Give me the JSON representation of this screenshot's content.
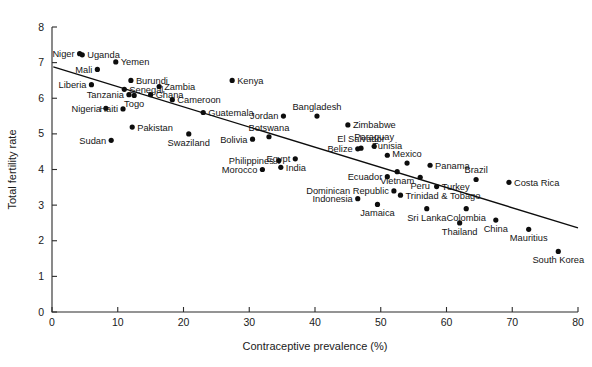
{
  "chart_data": {
    "type": "scatter",
    "title": "",
    "xlabel": "Contraceptive prevalence (%)",
    "ylabel": "Total fertility rate",
    "xlim": [
      0,
      80
    ],
    "ylim": [
      0,
      8
    ],
    "xticks": [
      0,
      10,
      20,
      30,
      40,
      50,
      60,
      70,
      80
    ],
    "yticks": [
      0,
      1,
      2,
      3,
      4,
      5,
      6,
      7,
      8
    ],
    "grid": false,
    "legend": "none",
    "point_color": "#0d0d0d",
    "line_color": "#0d0d0d",
    "trendline": {
      "label": "linear fit",
      "x_start": 0.2,
      "y_start": 6.88,
      "x_end": 80.0,
      "y_end": 2.36
    },
    "points": [
      {
        "label": "Niger",
        "x": 4.2,
        "y": 7.25,
        "lx": "right",
        "ly": "mid"
      },
      {
        "label": "Uganda",
        "x": 4.6,
        "y": 7.22,
        "lx": "left",
        "ly": "mid"
      },
      {
        "label": "Mali",
        "x": 6.9,
        "y": 6.81,
        "lx": "right",
        "ly": "mid"
      },
      {
        "label": "Yemen",
        "x": 9.7,
        "y": 7.02,
        "lx": "left",
        "ly": "mid"
      },
      {
        "label": "Burundi",
        "x": 12.0,
        "y": 6.5,
        "lx": "left",
        "ly": "above"
      },
      {
        "label": "Liberia",
        "x": 6.0,
        "y": 6.38,
        "lx": "right",
        "ly": "mid"
      },
      {
        "label": "Senegal",
        "x": 11.0,
        "y": 6.25,
        "lx": "left",
        "ly": "mid"
      },
      {
        "label": "Zambia",
        "x": 16.3,
        "y": 6.33,
        "lx": "left",
        "ly": "above"
      },
      {
        "label": "Tanzania",
        "x": 11.7,
        "y": 6.1,
        "lx": "right",
        "ly": "mid"
      },
      {
        "label": "Togo",
        "x": 12.5,
        "y": 6.08,
        "lx": "below",
        "ly": "below"
      },
      {
        "label": "Ghana",
        "x": 15.0,
        "y": 6.1,
        "lx": "left",
        "ly": "mid"
      },
      {
        "label": "Nigeria",
        "x": 8.2,
        "y": 5.72,
        "lx": "right",
        "ly": "mid"
      },
      {
        "label": "Haiti",
        "x": 10.8,
        "y": 5.7,
        "lx": "right",
        "ly": "mid"
      },
      {
        "label": "Cameroon",
        "x": 18.3,
        "y": 5.96,
        "lx": "left",
        "ly": "mid"
      },
      {
        "label": "Guatemala",
        "x": 23.0,
        "y": 5.6,
        "lx": "left",
        "ly": "mid"
      },
      {
        "label": "Pakistan",
        "x": 12.2,
        "y": 5.19,
        "lx": "left",
        "ly": "mid"
      },
      {
        "label": "Sudan",
        "x": 9.0,
        "y": 4.82,
        "lx": "right",
        "ly": "mid"
      },
      {
        "label": "Swaziland",
        "x": 20.8,
        "y": 5.0,
        "lx": "below",
        "ly": "below"
      },
      {
        "label": "Kenya",
        "x": 27.4,
        "y": 6.5,
        "lx": "left",
        "ly": "mid"
      },
      {
        "label": "Bangladesh",
        "x": 40.3,
        "y": 5.5,
        "lx": "above",
        "ly": "above"
      },
      {
        "label": "Jordan",
        "x": 35.2,
        "y": 5.5,
        "lx": "right",
        "ly": "mid"
      },
      {
        "label": "Zimbabwe",
        "x": 45.0,
        "y": 5.25,
        "lx": "left",
        "ly": "mid"
      },
      {
        "label": "Botswana",
        "x": 33.0,
        "y": 4.92,
        "lx": "above",
        "ly": "above"
      },
      {
        "label": "Bolivia",
        "x": 30.5,
        "y": 4.85,
        "lx": "right",
        "ly": "mid"
      },
      {
        "label": "El Salvador",
        "x": 47.0,
        "y": 4.6,
        "lx": "above",
        "ly": "above"
      },
      {
        "label": "Paraguay",
        "x": 49.0,
        "y": 4.65,
        "lx": "above",
        "ly": "above"
      },
      {
        "label": "Belize",
        "x": 46.5,
        "y": 4.58,
        "lx": "right",
        "ly": "mid"
      },
      {
        "label": "Tunisia",
        "x": 51.0,
        "y": 4.4,
        "lx": "above",
        "ly": "above"
      },
      {
        "label": "Egypt",
        "x": 37.0,
        "y": 4.3,
        "lx": "right",
        "ly": "mid"
      },
      {
        "label": "Philippines",
        "x": 34.5,
        "y": 4.25,
        "lx": "right",
        "ly": "mid"
      },
      {
        "label": "India",
        "x": 34.8,
        "y": 4.06,
        "lx": "left",
        "ly": "mid"
      },
      {
        "label": "Morocco",
        "x": 32.0,
        "y": 4.0,
        "lx": "right",
        "ly": "mid"
      },
      {
        "label": "Mexico",
        "x": 54.0,
        "y": 4.18,
        "lx": "above",
        "ly": "above"
      },
      {
        "label": "Panama",
        "x": 57.5,
        "y": 4.12,
        "lx": "left",
        "ly": "mid"
      },
      {
        "label": "Vietnam",
        "x": 52.5,
        "y": 3.94,
        "lx": "below",
        "ly": "below"
      },
      {
        "label": "Ecuador",
        "x": 51.0,
        "y": 3.8,
        "lx": "right",
        "ly": "mid"
      },
      {
        "label": "Peru",
        "x": 56.0,
        "y": 3.78,
        "lx": "below",
        "ly": "below"
      },
      {
        "label": "Brazil",
        "x": 64.5,
        "y": 3.72,
        "lx": "above",
        "ly": "above"
      },
      {
        "label": "Costa Rica",
        "x": 69.5,
        "y": 3.64,
        "lx": "left",
        "ly": "mid"
      },
      {
        "label": "Turkey",
        "x": 58.5,
        "y": 3.52,
        "lx": "left",
        "ly": "mid"
      },
      {
        "label": "Dominican Republic",
        "x": 52.0,
        "y": 3.4,
        "lx": "right",
        "ly": "mid"
      },
      {
        "label": "Trinidad & Tobago",
        "x": 53.0,
        "y": 3.28,
        "lx": "left",
        "ly": "mid"
      },
      {
        "label": "Indonesia",
        "x": 46.5,
        "y": 3.18,
        "lx": "right",
        "ly": "mid"
      },
      {
        "label": "Jamaica",
        "x": 49.5,
        "y": 3.02,
        "lx": "below",
        "ly": "below"
      },
      {
        "label": "Sri Lanka",
        "x": 57.0,
        "y": 2.9,
        "lx": "below",
        "ly": "below"
      },
      {
        "label": "Colombia",
        "x": 63.0,
        "y": 2.9,
        "lx": "below",
        "ly": "below"
      },
      {
        "label": "Thailand",
        "x": 62.0,
        "y": 2.5,
        "lx": "below",
        "ly": "below"
      },
      {
        "label": "China",
        "x": 67.5,
        "y": 2.58,
        "lx": "below",
        "ly": "below"
      },
      {
        "label": "Mauritius",
        "x": 72.5,
        "y": 2.32,
        "lx": "below",
        "ly": "below"
      },
      {
        "label": "South Korea",
        "x": 77.0,
        "y": 1.7,
        "lx": "below",
        "ly": "below"
      }
    ]
  }
}
